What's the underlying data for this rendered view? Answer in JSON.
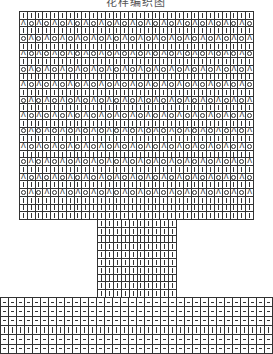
{
  "title": "花样编织图",
  "colors": {
    "line": "#333333",
    "background": "#ffffff"
  },
  "symbols": {
    "k": "knit (|)",
    "p": "purl (—)",
    "o": "yarn over (○)",
    "dec": "decrease (Λ)"
  },
  "main_chart": {
    "left": 19,
    "top": 11,
    "width": 234,
    "height": 208,
    "cols": 30,
    "rows": [
      "k",
      "A",
      "k",
      "B",
      "k",
      "A",
      "k",
      "B",
      "k",
      "A",
      "k",
      "B",
      "k",
      "A",
      "k",
      "B",
      "k",
      "A",
      "k",
      "B",
      "k",
      "A",
      "k",
      "B",
      "k",
      "k",
      "k"
    ]
  },
  "stem_chart": {
    "left": 97,
    "top": 219,
    "width": 79,
    "height": 78,
    "cols": 10,
    "rows": [
      "k",
      "k",
      "k",
      "k",
      "k",
      "k",
      "k",
      "k",
      "k",
      "k"
    ]
  },
  "bottom_band": {
    "left": 0,
    "top": 297,
    "width": 272,
    "height": 56,
    "cols": 34,
    "rows": [
      "p",
      "p",
      "p",
      "k",
      "p",
      "p"
    ]
  }
}
